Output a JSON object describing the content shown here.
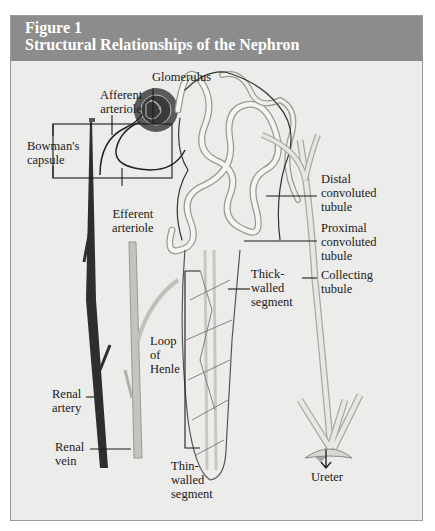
{
  "figure": {
    "number": "Figure 1",
    "title": "Structural Relationships of the Nephron",
    "colors": {
      "header_bg": "#8c8c8c",
      "body_bg": "#ececeb",
      "header_text": "#ffffff",
      "artery": "#2b2b2b",
      "vein": "#b8b8b0",
      "tubule": "#d8d8d2"
    }
  },
  "labels": {
    "glomerulus": "Glomerulus",
    "afferent_arteriole": "Afferent\narteriole",
    "bowmans_capsule": "Bowman's\ncapsule",
    "efferent_arteriole": "Efferent\narteriole",
    "distal_convoluted_tubule": "Distal\nconvoluted\ntubule",
    "proximal_convoluted_tubule": "Proximal\nconvoluted\ntubule",
    "thick_walled_segment": "Thick-\nwalled\nsegment",
    "collecting_tubule": "Collecting\ntubule",
    "loop_of_henle": "Loop\nof\nHenle",
    "renal_artery": "Renal\nartery",
    "renal_vein": "Renal\nvein",
    "thin_walled_segment": "Thin-\nwalled\nsegment",
    "ureter": "Ureter"
  }
}
